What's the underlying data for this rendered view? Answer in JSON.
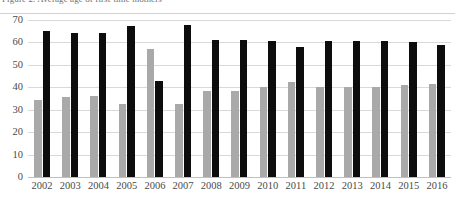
{
  "figure": {
    "caption_clipped": "Figure 2. Average age of first-time mothers",
    "name": "grouped-bar-chart"
  },
  "chart_data": {
    "type": "bar",
    "title": "",
    "subtitle": "",
    "xlabel": "",
    "ylabel": "",
    "ylim": [
      0,
      70
    ],
    "ytick_step": 10,
    "yticks": [
      0,
      10,
      20,
      30,
      40,
      50,
      60,
      70
    ],
    "ytick_labels": [
      "0",
      "10",
      "20",
      "30",
      "40",
      "50",
      "60",
      "70"
    ],
    "grid": true,
    "grid_axis": "y",
    "legend": null,
    "legend_position": "none",
    "categories": [
      "2002",
      "2003",
      "2004",
      "2005",
      "2006",
      "2007",
      "2008",
      "2009",
      "2010",
      "2011",
      "2012",
      "2013",
      "2014",
      "2015",
      "2016"
    ],
    "series": [
      {
        "name": "gray-series",
        "color": "#a9a9a9",
        "values": [
          34.5,
          35.5,
          36.0,
          32.5,
          57.0,
          32.5,
          38.5,
          38.5,
          40.0,
          42.5,
          40.0,
          40.0,
          40.0,
          41.0,
          41.5
        ]
      },
      {
        "name": "black-series",
        "color": "#0d0d0d",
        "values": [
          65.0,
          64.0,
          64.0,
          67.5,
          43.0,
          68.0,
          61.0,
          61.0,
          60.5,
          58.0,
          60.5,
          60.5,
          60.5,
          60.0,
          59.0
        ]
      }
    ]
  }
}
